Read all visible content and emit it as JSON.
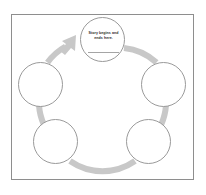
{
  "worksheet": {
    "title": "Story Cycle Organizer",
    "border_color": "#8e8e8e",
    "background_color": "#ffffff"
  },
  "diagram": {
    "type": "cycle",
    "direction": "clockwise",
    "ring_color": "#c8c8c8",
    "node_outline_color": "#9a9a9a",
    "node_fill_color": "#ffffff",
    "node_count": 5,
    "nodes": [
      {
        "id": "start",
        "position": "top-center",
        "label": "Story begins and ends here.",
        "has_write_line": true
      },
      {
        "id": "right",
        "position": "right",
        "label": "",
        "has_write_line": false
      },
      {
        "id": "bottom-right",
        "position": "bottom-right",
        "label": "",
        "has_write_line": false
      },
      {
        "id": "bottom-left",
        "position": "bottom-left",
        "label": "",
        "has_write_line": false
      },
      {
        "id": "left",
        "position": "left",
        "label": "",
        "has_write_line": false
      }
    ],
    "arrow": {
      "count": 1,
      "points_to": "start",
      "color": "#c8c8c8"
    }
  }
}
